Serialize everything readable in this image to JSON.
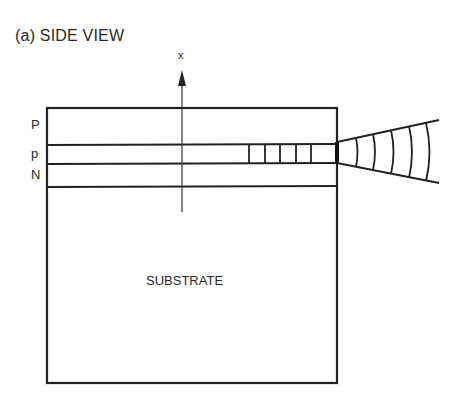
{
  "title": "(a) SIDE VIEW",
  "axis": {
    "label": "x",
    "direction": "up"
  },
  "layers": [
    {
      "label": "P",
      "name": "upper-cladding"
    },
    {
      "label": "p",
      "name": "active-layer"
    },
    {
      "label": "N",
      "name": "lower-cladding"
    }
  ],
  "substrate": {
    "label": "SUBSTRATE"
  },
  "features": {
    "active_region_cells": 5,
    "emission_wavefronts": 5
  },
  "colors": {
    "line": "#222222",
    "background": "#ffffff"
  }
}
